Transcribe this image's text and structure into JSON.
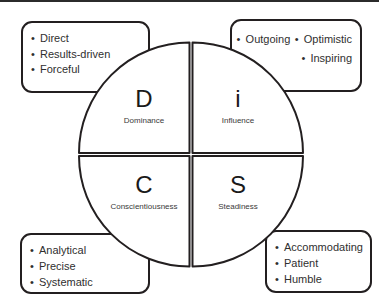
{
  "diagram": {
    "style": {
      "background": "#ffffff",
      "line_color": "#231f20",
      "text_color": "#2f2f2f",
      "label_color": "#1a1a1a"
    },
    "quadrants": [
      {
        "id": "d",
        "position": "top-left",
        "letter": "D",
        "name": "Dominance",
        "traits": [
          "Direct",
          "Results-driven",
          "Forceful"
        ]
      },
      {
        "id": "i",
        "position": "top-right",
        "letter": "i",
        "name": "Influence",
        "traits": [
          "Outgoing",
          "Optimistic",
          "Inspiring"
        ]
      },
      {
        "id": "c",
        "position": "bottom-left",
        "letter": "C",
        "name": "Conscientiousness",
        "traits": [
          "Analytical",
          "Precise",
          "Systematic"
        ]
      },
      {
        "id": "s",
        "position": "bottom-right",
        "letter": "S",
        "name": "Steadiness",
        "traits": [
          "Accommodating",
          "Patient",
          "Humble"
        ]
      }
    ],
    "bullet_glyph": "•"
  }
}
